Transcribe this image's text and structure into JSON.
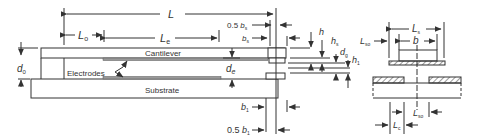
{
  "diagram": {
    "type": "MEMS cantilever cross-section and side view",
    "colors": {
      "line": "#333333",
      "background": "#ffffff",
      "electrode_fill": "#999999"
    },
    "main_view": {
      "labels": {
        "cantilever": "Cantilever",
        "substrate": "Substrate",
        "electrodes": "Electrodes"
      },
      "dimensions": {
        "L": "L",
        "L0_main": "L",
        "L0_sub": "o",
        "Le_main": "L",
        "Le_sub": "e",
        "d0_main": "d",
        "d0_sub": "0",
        "de_main": "d",
        "de_sub": "e",
        "dg_main": "d",
        "dg_sub": "g",
        "h": "h",
        "hs_main": "h",
        "hs_sub": "s",
        "h1_main": "h",
        "h1_sub": "1",
        "half_bs_prefix": "0.5 ",
        "half_bs_main": "b",
        "half_bs_sub": "s",
        "bs_main": "b",
        "bs_sub": "s",
        "b1_main": "b",
        "b1_sub": "1",
        "half_b1_prefix": "0.5 ",
        "half_b1_main": "b",
        "half_b1_sub": "1"
      }
    },
    "side_view": {
      "dimensions": {
        "Ls_main": "L",
        "Ls_sub": "s",
        "b": "b",
        "Lso_left_main": "L",
        "Lso_left_sub": "so",
        "Lso_right_main": "L",
        "Lso_right_sub": "so",
        "Lc_main": "L",
        "Lc_sub": "c"
      }
    }
  }
}
